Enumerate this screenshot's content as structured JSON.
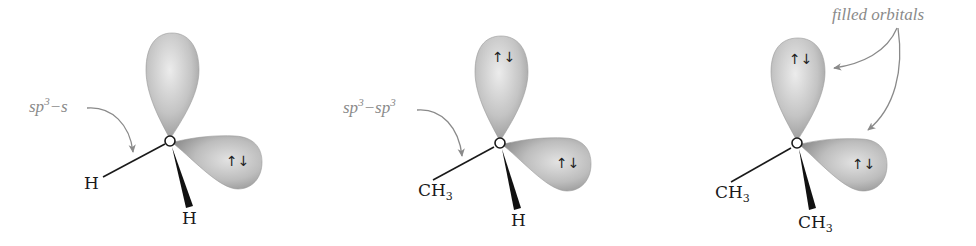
{
  "colors": {
    "lobe_light": "#e6e6e6",
    "lobe_mid": "#b9b9b9",
    "lobe_dark": "#8c8c8c",
    "bond": "#1a1a1a",
    "annotation": "#8a8a8a"
  },
  "spin_pair": "↑↓",
  "panels": [
    {
      "name": "water",
      "center_atom": "O",
      "left_substituent": {
        "main": "H",
        "sub": ""
      },
      "wedge_substituent": {
        "main": "H",
        "sub": ""
      },
      "annotation": {
        "base": "sp",
        "sup": "3",
        "rest": "−s"
      },
      "upper_lobe_spin": "",
      "right_lobe_spin": "↑↓"
    },
    {
      "name": "methanol",
      "center_atom": "O",
      "left_substituent": {
        "main": "CH",
        "sub": "3"
      },
      "wedge_substituent": {
        "main": "H",
        "sub": ""
      },
      "annotation": {
        "base": "sp",
        "sup": "3",
        "mid": "−sp",
        "sup2": "3"
      },
      "upper_lobe_spin": "↑↓",
      "right_lobe_spin": "↑↓"
    },
    {
      "name": "dimethyl-ether",
      "center_atom": "O",
      "left_substituent": {
        "main": "CH",
        "sub": "3"
      },
      "wedge_substituent": {
        "main": "CH",
        "sub": "3"
      },
      "annotation": {
        "text": "filled orbitals"
      },
      "upper_lobe_spin": "↑↓",
      "right_lobe_spin": "↑↓"
    }
  ]
}
